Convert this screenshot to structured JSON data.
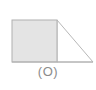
{
  "figure": {
    "caption": "(O)",
    "colors": {
      "background": "#ffffff",
      "square_fill": "#e4e4e4",
      "square_stroke": "#b0b0b0",
      "triangle_fill": "#ffffff",
      "triangle_stroke": "#b8b8b8",
      "baseline_stroke": "#b0b0b0",
      "caption_text": "#8c8c8c"
    },
    "shapes": [
      {
        "name": "shaded-square",
        "type": "rect",
        "x": 12,
        "y": 20,
        "width": 45,
        "height": 42,
        "filled": "true"
      },
      {
        "name": "right-triangle",
        "type": "polygon",
        "points": "57,20 93,62 57,62",
        "filled": "false"
      },
      {
        "name": "baseline",
        "type": "line",
        "x1": 12,
        "y1": 62,
        "x2": 93,
        "y2": 62
      }
    ]
  }
}
